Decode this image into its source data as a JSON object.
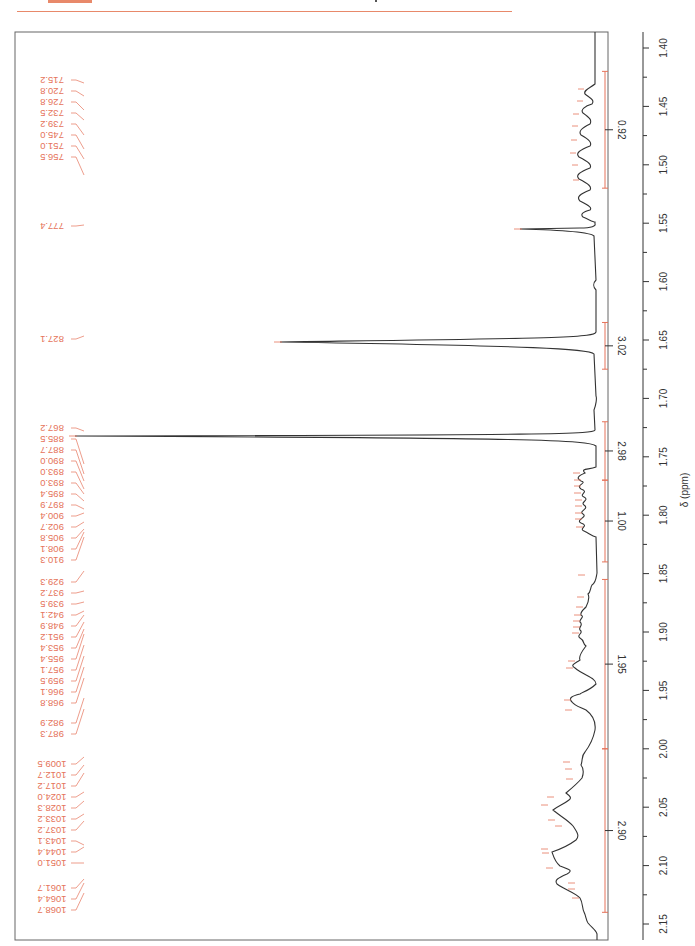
{
  "page": {
    "header_color": "#e8896a"
  },
  "chart_data": {
    "type": "line",
    "xlabel": "δ (ppm)",
    "ylabel": "",
    "orientation": "rotated 90°, chemical shift axis vertical on right",
    "xlim": [
      1.4,
      2.15
    ],
    "x_ticks": [
      "1.40",
      "1.45",
      "1.50",
      "1.55",
      "1.60",
      "1.65",
      "1.70",
      "1.75",
      "1.80",
      "1.85",
      "1.90",
      "1.95",
      "2.00",
      "2.05",
      "2.10",
      "2.15"
    ],
    "grid": false,
    "colors": {
      "spectrum": "#333333",
      "annotations": "#e5735a"
    },
    "peak_labels_hz": [
      "715.2",
      "720.8",
      "726.8",
      "732.5",
      "739.2",
      "745.0",
      "751.0",
      "756.5",
      "777.4",
      "827.1",
      "867.2",
      "885.5",
      "887.7",
      "890.0",
      "893.0",
      "893.0",
      "895.4",
      "897.9",
      "900.4",
      "902.7",
      "905.8",
      "908.1",
      "910.3",
      "929.3",
      "937.2",
      "939.5",
      "942.1",
      "948.9",
      "951.2",
      "953.4",
      "955.4",
      "957.1",
      "959.5",
      "966.1",
      "968.8",
      "982.9",
      "987.3",
      "1009.5",
      "1012.7",
      "1017.2",
      "1024.0",
      "1028.3",
      "1033.2",
      "1037.2",
      "1043.1",
      "1044.4",
      "1051.0",
      "1061.7",
      "1064.4",
      "1068.7"
    ],
    "integrals": [
      {
        "range": [
          1.42,
          1.52
        ],
        "value": "0.92"
      },
      {
        "range": [
          1.635,
          1.675
        ],
        "value": "3.02"
      },
      {
        "range": [
          1.72,
          1.77
        ],
        "value": "2.98"
      },
      {
        "range": [
          1.77,
          1.84
        ],
        "value": "1.00"
      },
      {
        "range": [
          1.855,
          2.0
        ],
        "value": "1.95"
      },
      {
        "range": [
          2.0,
          2.14
        ],
        "value": "2.90"
      }
    ],
    "major_peaks": [
      {
        "shift": 1.555,
        "relative_height": 0.16,
        "label": "777.4"
      },
      {
        "shift": 1.655,
        "relative_height": 0.55,
        "label": "827.1"
      },
      {
        "shift": 1.735,
        "relative_height": 1.0,
        "label": "867.2"
      }
    ]
  }
}
